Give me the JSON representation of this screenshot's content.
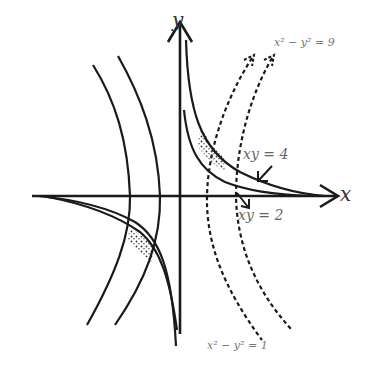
{
  "diagram": {
    "type": "coordinate-plane-hyperbolas",
    "axes": {
      "x_label": "x",
      "y_label": "y"
    },
    "curves": [
      {
        "name": "xy = 4",
        "style": "solid",
        "label": "xy = 4"
      },
      {
        "name": "xy = 2",
        "style": "solid",
        "label": "xy = 2"
      },
      {
        "name": "x^2 - y^2 = 9",
        "style": "dashed",
        "label": "x² − y² = 9"
      },
      {
        "name": "x^2 - y^2 = 1",
        "style": "dashed",
        "label": "x² − y² = 1"
      }
    ],
    "shaded_regions": [
      {
        "quadrant": "I",
        "description": "region bounded by xy=2, xy=4, x²−y²=1, x²−y²=9",
        "fill": "dotted"
      },
      {
        "quadrant": "III",
        "description": "mirror region in third quadrant",
        "fill": "dotted"
      }
    ],
    "colors": {
      "stroke": "#1a1a1a",
      "background": "#ffffff",
      "label": "#666666"
    }
  }
}
